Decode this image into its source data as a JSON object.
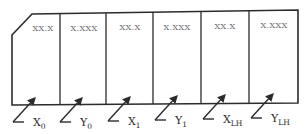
{
  "diagram": {
    "type": "display-field-layout",
    "cells": [
      {
        "id": "x0",
        "format": "XX.X"
      },
      {
        "id": "y0",
        "format": "X.XXX"
      },
      {
        "id": "x1",
        "format": "XX.X"
      },
      {
        "id": "y1",
        "format": "X.XXX"
      },
      {
        "id": "xlh",
        "format": "XX.X"
      },
      {
        "id": "ylh",
        "format": "X.XXX"
      }
    ],
    "signals": [
      {
        "main": "X",
        "sub": "0"
      },
      {
        "main": "Y",
        "sub": "0"
      },
      {
        "main": "X",
        "sub": "1"
      },
      {
        "main": "Y",
        "sub": "1"
      },
      {
        "main": "X",
        "sub": "LH"
      },
      {
        "main": "Y",
        "sub": "LH"
      }
    ],
    "colors": {
      "line": "#2b2b2b",
      "cell_text": "#6a6a6a",
      "signal_text": "#2a2a2a",
      "background": "#ffffff"
    }
  }
}
